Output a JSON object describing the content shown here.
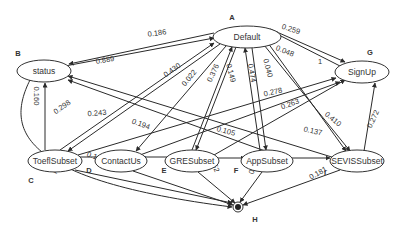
{
  "nodes": [
    {
      "id": "A",
      "label": "Default",
      "letter": "A",
      "cx": 247,
      "cy": 37,
      "rx": 34,
      "ry": 11,
      "lx": 232,
      "ly": 17
    },
    {
      "id": "B",
      "label": "status",
      "letter": "B",
      "cx": 44,
      "cy": 71,
      "rx": 27,
      "ry": 11,
      "lx": 18,
      "ly": 53
    },
    {
      "id": "C",
      "label": "ToeflSubset",
      "letter": "C",
      "cx": 55,
      "cy": 161,
      "rx": 27,
      "ry": 11,
      "lx": 31,
      "ly": 180
    },
    {
      "id": "D",
      "label": "ContactUs",
      "letter": "D",
      "cx": 121,
      "cy": 161,
      "rx": 26,
      "ry": 11,
      "lx": 89,
      "ly": 170
    },
    {
      "id": "E",
      "label": "GRESubset",
      "letter": "E",
      "cx": 192,
      "cy": 161,
      "rx": 27,
      "ry": 11,
      "lx": 164,
      "ly": 170
    },
    {
      "id": "F",
      "label": "AppSubset",
      "letter": "F",
      "cx": 267,
      "cy": 161,
      "rx": 26,
      "ry": 11,
      "lx": 236,
      "ly": 170
    },
    {
      "id": "G",
      "label": "SignUp",
      "letter": "G",
      "cx": 362,
      "cy": 72,
      "rx": 27,
      "ry": 11,
      "lx": 370,
      "ly": 52
    },
    {
      "id": "I",
      "label": "SEVISSubset",
      "letter": "I",
      "cx": 357,
      "cy": 161,
      "rx": 27,
      "ry": 11,
      "lx": 325,
      "ly": 172
    },
    {
      "id": "H",
      "label": "",
      "letter": "H",
      "cx": 238,
      "cy": 207,
      "rx": 0,
      "ry": 0,
      "lx": 255,
      "ly": 219
    }
  ],
  "edges": [
    {
      "from": "A",
      "to": "B",
      "label": "0.186",
      "lx": 157,
      "ly": 33,
      "rot": -8
    },
    {
      "from": "B",
      "to": "A",
      "label": "0.889",
      "lx": 105,
      "ly": 60,
      "rot": -10
    },
    {
      "from": "A",
      "to": "C",
      "label": "0.430",
      "lx": 172,
      "ly": 70,
      "rot": -35
    },
    {
      "from": "A",
      "to": "D",
      "label": "0.022",
      "lx": 189,
      "ly": 78,
      "rot": -50
    },
    {
      "from": "E",
      "to": "A",
      "label": "0.376",
      "lx": 213,
      "ly": 73,
      "rot": -65
    },
    {
      "from": "A",
      "to": "E",
      "label": "0.149",
      "lx": 231,
      "ly": 73,
      "rot": 75
    },
    {
      "from": "F",
      "to": "A",
      "label": "0.474",
      "lx": 252,
      "ly": 73,
      "rot": 80
    },
    {
      "from": "A",
      "to": "F",
      "label": "0.040",
      "lx": 268,
      "ly": 68,
      "rot": 75
    },
    {
      "from": "A",
      "to": "G",
      "label": "0.259",
      "lx": 291,
      "ly": 29,
      "rot": 18
    },
    {
      "from": "G",
      "to": "A",
      "label": "0.048",
      "lx": 285,
      "ly": 51,
      "rot": 22
    },
    {
      "from": "A",
      "to": "G",
      "label": "1",
      "lx": 320,
      "ly": 61,
      "rot": 0
    },
    {
      "from": "B",
      "to": "H",
      "label": "0.160",
      "lx": 36,
      "ly": 96,
      "rot": 90
    },
    {
      "from": "C",
      "to": "B",
      "label": "0.298",
      "lx": 62,
      "ly": 107,
      "rot": -35
    },
    {
      "from": "I",
      "to": "B",
      "label": "0.243",
      "lx": 97,
      "ly": 113,
      "rot": -5
    },
    {
      "from": "C",
      "to": "G",
      "label": "0.278",
      "lx": 273,
      "ly": 92,
      "rot": -12
    },
    {
      "from": "D",
      "to": "G",
      "label": "0.263",
      "lx": 290,
      "ly": 104,
      "rot": -20
    },
    {
      "from": "A",
      "to": "I",
      "label": "0.410",
      "lx": 333,
      "ly": 119,
      "rot": 40
    },
    {
      "from": "I",
      "to": "G",
      "label": "0.272",
      "lx": 373,
      "ly": 119,
      "rot": -65
    },
    {
      "from": "C",
      "to": "D",
      "label": "0.194",
      "lx": 141,
      "ly": 124,
      "rot": 20
    },
    {
      "from": "E",
      "to": "F",
      "label": "0.105",
      "lx": 226,
      "ly": 131,
      "rot": 15
    },
    {
      "from": "F",
      "to": "I",
      "label": "0.137",
      "lx": 313,
      "ly": 131,
      "rot": 12
    },
    {
      "from": "C",
      "to": "H",
      "label": "0.167",
      "lx": 96,
      "ly": 157,
      "rot": 20
    },
    {
      "from": "D",
      "to": "H",
      "label": "1",
      "lx": 145,
      "ly": 158,
      "rot": 0
    },
    {
      "from": "B",
      "to": "H",
      "label": "0.111",
      "lx": 50,
      "ly": 168,
      "rot": 25
    },
    {
      "from": "E",
      "to": "H",
      "label": "0.152",
      "lx": 214,
      "ly": 163,
      "rot": 70
    },
    {
      "from": "F",
      "to": "H",
      "label": "0.158",
      "lx": 254,
      "ly": 165,
      "rot": -70
    },
    {
      "from": "I",
      "to": "H",
      "label": "0.181",
      "lx": 318,
      "ly": 173,
      "rot": -30
    }
  ]
}
